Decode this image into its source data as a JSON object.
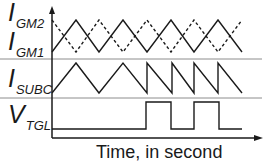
{
  "diagram": {
    "title": "",
    "x_axis_label": "Time, in second",
    "signals": [
      {
        "id": "gm2",
        "name": "I",
        "subscript": "GM2",
        "style": "dashed"
      },
      {
        "id": "gm1",
        "name": "I",
        "subscript": "GM1",
        "style": "solid"
      },
      {
        "id": "subc",
        "name": "I",
        "subscript": "SUBC",
        "style": "solid"
      },
      {
        "id": "tgl",
        "name": "V",
        "subscript": "TGL",
        "style": "solid"
      }
    ],
    "colors": {
      "trace": "#1a1a1a",
      "separator": "#8c8c8c",
      "axis": "#1a1a1a"
    }
  }
}
